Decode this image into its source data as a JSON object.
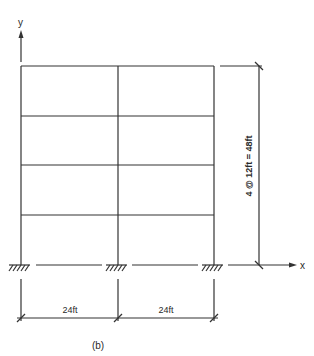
{
  "diagram": {
    "type": "structural-frame",
    "axes": {
      "y_label": "y",
      "x_label": "x"
    },
    "bays": 2,
    "stories": 4,
    "bay_width_label_1": "24ft",
    "bay_width_label_2": "24ft",
    "height_label": "4 @ 12ft = 48ft",
    "caption": "(b)",
    "supports": [
      "fixed",
      "fixed",
      "fixed"
    ],
    "line_color": "#333333"
  }
}
